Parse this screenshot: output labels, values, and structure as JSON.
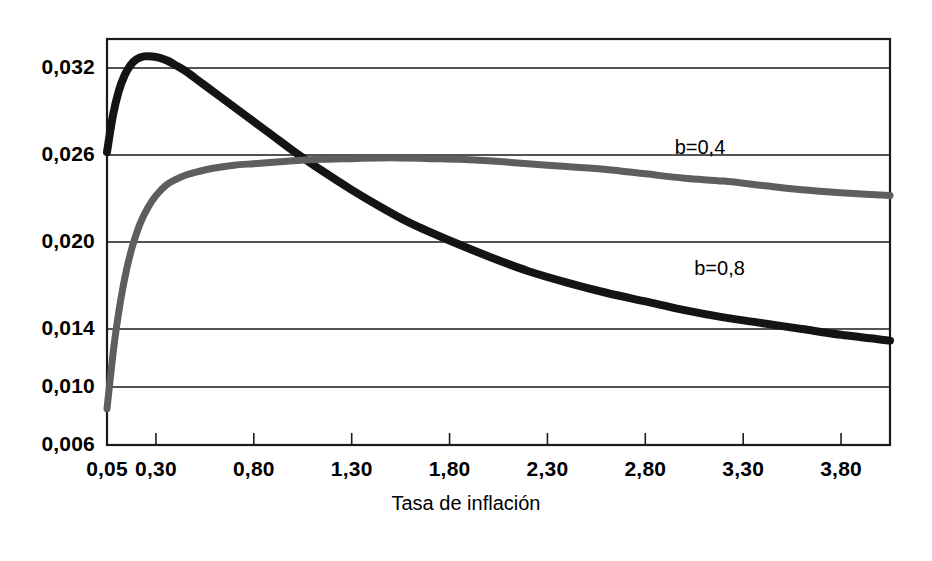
{
  "chart_data": {
    "type": "line",
    "title": "",
    "subtitle": "",
    "xlabel": "Tasa de inflación",
    "ylabel": "",
    "xlim": [
      0.05,
      4.05
    ],
    "ylim": [
      0.006,
      0.034
    ],
    "grid": true,
    "grid_axis": "y",
    "legend_position": "inline-annotations",
    "x_tick_labels": [
      "0,05",
      "0,30",
      "0,80",
      "1,30",
      "1,80",
      "2,30",
      "2,80",
      "3,30",
      "3,80"
    ],
    "x_tick_values": [
      0.05,
      0.3,
      0.8,
      1.3,
      1.8,
      2.3,
      2.8,
      3.3,
      3.8
    ],
    "y_tick_labels": [
      "0,032",
      "0,026",
      "0,020",
      "0,014",
      "0,010",
      "0,006"
    ],
    "y_tick_values": [
      0.032,
      0.026,
      0.02,
      0.014,
      0.01,
      0.006
    ],
    "series": [
      {
        "name": "b=0,8",
        "color": "#141414",
        "annotation": "b=0,8",
        "annotation_x": 3.05,
        "annotation_y": 0.0172,
        "x": [
          0.05,
          0.08,
          0.11,
          0.14,
          0.17,
          0.2,
          0.24,
          0.28,
          0.32,
          0.36,
          0.4,
          0.45,
          0.5,
          0.6,
          0.7,
          0.8,
          0.9,
          1.0,
          1.15,
          1.3,
          1.45,
          1.6,
          1.8,
          2.0,
          2.2,
          2.4,
          2.6,
          2.8,
          3.0,
          3.2,
          3.4,
          3.6,
          3.8,
          4.05
        ],
        "y": [
          0.0262,
          0.0287,
          0.0304,
          0.0315,
          0.0322,
          0.0326,
          0.0328,
          0.0328,
          0.0327,
          0.0325,
          0.0322,
          0.0318,
          0.0313,
          0.0303,
          0.0293,
          0.0283,
          0.0273,
          0.0263,
          0.0249,
          0.0236,
          0.0224,
          0.0213,
          0.0201,
          0.019,
          0.018,
          0.0172,
          0.0165,
          0.0159,
          0.0153,
          0.0148,
          0.0144,
          0.014,
          0.0136,
          0.0132
        ]
      },
      {
        "name": "b=0,4",
        "color": "#5e5e5e",
        "annotation": "b=0,4",
        "annotation_x": 2.95,
        "annotation_y": 0.0255,
        "x": [
          0.05,
          0.07,
          0.09,
          0.12,
          0.15,
          0.18,
          0.22,
          0.26,
          0.3,
          0.35,
          0.4,
          0.45,
          0.5,
          0.6,
          0.7,
          0.8,
          0.9,
          1.0,
          1.15,
          1.3,
          1.45,
          1.55,
          1.7,
          1.85,
          2.0,
          2.2,
          2.4,
          2.6,
          2.8,
          3.0,
          3.2,
          3.4,
          3.6,
          3.8,
          4.05
        ],
        "y": [
          0.0085,
          0.011,
          0.0133,
          0.016,
          0.0181,
          0.0197,
          0.0213,
          0.0224,
          0.0232,
          0.0239,
          0.0243,
          0.0246,
          0.0248,
          0.0251,
          0.0253,
          0.0254,
          0.0255,
          0.0256,
          0.0257,
          0.02575,
          0.0258,
          0.0258,
          0.02575,
          0.0257,
          0.0256,
          0.0254,
          0.0252,
          0.025,
          0.0247,
          0.0244,
          0.0242,
          0.0239,
          0.0236,
          0.0234,
          0.0232
        ]
      }
    ]
  },
  "axis": {
    "x_title": "Tasa de inflación"
  },
  "colors": {
    "frame": "#1a1a1a",
    "grid": "#1a1a1a",
    "background": "#ffffff",
    "series_black": "#141414",
    "series_gray": "#5e5e5e"
  }
}
